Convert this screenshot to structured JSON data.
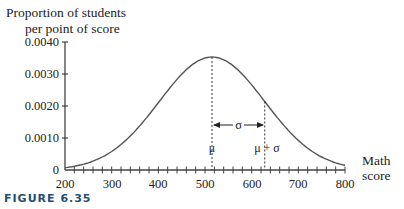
{
  "chart_data": {
    "type": "line",
    "title": "",
    "ylabel": "Proportion of students per point of score",
    "ylabel_lines": [
      "Proportion of students",
      "per point of score"
    ],
    "xlabel": "Math score",
    "xlabel_lines": [
      "Math",
      "score"
    ],
    "xlim": [
      200,
      800
    ],
    "ylim": [
      0,
      0.004
    ],
    "x_ticks": [
      200,
      300,
      400,
      500,
      600,
      700,
      800
    ],
    "x_tick_labels": [
      "200",
      "300",
      "400",
      "500",
      "600",
      "700",
      "800"
    ],
    "x_minor_tick_step": 20,
    "y_ticks": [
      0,
      0.001,
      0.002,
      0.003,
      0.004
    ],
    "y_tick_labels": [
      "0",
      "0.0010",
      "0.0020",
      "0.0030",
      "0.0040"
    ],
    "series": [
      {
        "name": "Normal distribution of math scores",
        "mean": 515,
        "sd": 113,
        "x": [
          200,
          250,
          300,
          350,
          400,
          450,
          500,
          515,
          550,
          600,
          650,
          700,
          750,
          800
        ],
        "values": [
          7e-05,
          0.00022,
          0.00058,
          0.00121,
          0.0021,
          0.00302,
          0.0035,
          0.00353,
          0.00336,
          0.00267,
          0.00173,
          0.00093,
          0.00041,
          0.00014
        ]
      }
    ],
    "annotations": [
      {
        "text": "μ",
        "x": 515
      },
      {
        "text": "μ + σ",
        "x": 628
      },
      {
        "text": "σ",
        "type": "double-arrow",
        "from": 515,
        "to": 628
      }
    ],
    "grid": false,
    "legend": "none"
  },
  "caption": "FIGURE 6.35"
}
